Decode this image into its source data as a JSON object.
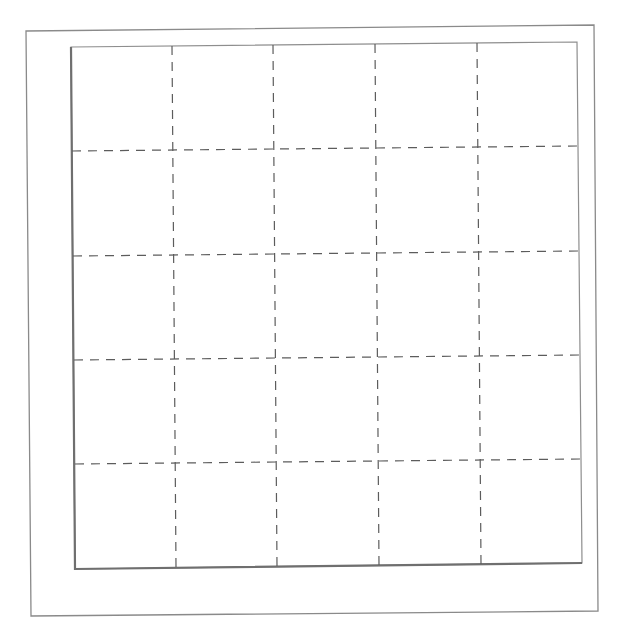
{
  "diagram": {
    "type": "dashed-grid",
    "rows": 5,
    "columns": 5,
    "colors": {
      "background": "#ffffff",
      "frame": "#8a8a8a",
      "grid": "#5c5c5c"
    },
    "outer_frame": [
      [
        26,
        31
      ],
      [
        594,
        25
      ],
      [
        598,
        611
      ],
      [
        31,
        616
      ]
    ],
    "inner_box": [
      [
        71,
        47
      ],
      [
        577,
        42
      ],
      [
        582,
        563
      ],
      [
        75,
        569
      ]
    ],
    "vertical_lines": [
      {
        "x1": 172,
        "y1": 46,
        "x2": 176,
        "y2": 567
      },
      {
        "x1": 273,
        "y1": 45,
        "x2": 277,
        "y2": 566
      },
      {
        "x1": 375,
        "y1": 44,
        "x2": 379,
        "y2": 565
      },
      {
        "x1": 477,
        "y1": 43,
        "x2": 481,
        "y2": 564
      }
    ],
    "horizontal_lines": [
      {
        "x1": 72,
        "y1": 151,
        "x2": 578,
        "y2": 146
      },
      {
        "x1": 73,
        "y1": 256,
        "x2": 579,
        "y2": 251
      },
      {
        "x1": 74,
        "y1": 360,
        "x2": 580,
        "y2": 355
      },
      {
        "x1": 75,
        "y1": 464,
        "x2": 581,
        "y2": 459
      }
    ]
  }
}
